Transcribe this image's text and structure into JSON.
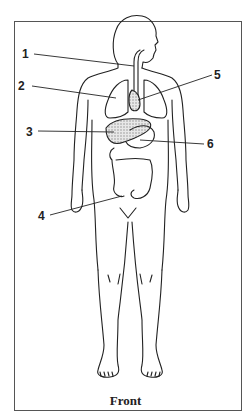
{
  "diagram": {
    "title": "Front",
    "labels": [
      {
        "id": "1",
        "text": "1",
        "x": 22,
        "y": 48,
        "target": "esophagus"
      },
      {
        "id": "2",
        "text": "2",
        "x": 18,
        "y": 80,
        "target": "lung"
      },
      {
        "id": "3",
        "text": "3",
        "x": 26,
        "y": 126,
        "target": "liver"
      },
      {
        "id": "4",
        "text": "4",
        "x": 38,
        "y": 210,
        "target": "large intestine"
      },
      {
        "id": "5",
        "text": "5",
        "x": 214,
        "y": 69,
        "target": "heart"
      },
      {
        "id": "6",
        "text": "6",
        "x": 207,
        "y": 138,
        "target": "stomach"
      }
    ],
    "colors": {
      "line": "#222222",
      "frame": "#555555",
      "shading": "#bbbbbb",
      "background": "#ffffff"
    }
  }
}
